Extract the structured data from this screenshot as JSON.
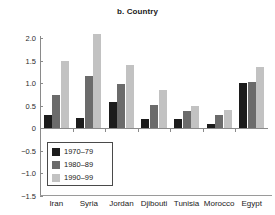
{
  "chart_data": {
    "type": "bar",
    "title": "b. Country",
    "xlabel": "",
    "ylabel": "",
    "ylim": [
      -1.5,
      2.0
    ],
    "ytick_labels": [
      "2.0",
      "1.5",
      "1.0",
      "0.5",
      "0",
      "−0.5",
      "−1.0",
      "−1.5"
    ],
    "ytick_values": [
      2.0,
      1.5,
      1.0,
      0.5,
      0,
      -0.5,
      -1.0,
      -1.5
    ],
    "grid": false,
    "legend_position": "lower-left-inside",
    "categories": [
      "Iran",
      "Syria",
      "Jordan",
      "Djibouti",
      "Tunisia",
      "Morocco",
      "Egypt"
    ],
    "series": [
      {
        "name": "1970–79",
        "color": "#1c1c1c",
        "values": [
          0.3,
          0.22,
          0.57,
          0.2,
          0.2,
          0.1,
          1.0
        ]
      },
      {
        "name": "1980–89",
        "color": "#6b6b6b",
        "values": [
          0.74,
          1.15,
          0.98,
          0.51,
          0.37,
          0.29,
          1.02
        ]
      },
      {
        "name": "1990–99",
        "color": "#c2c2c2",
        "values": [
          1.49,
          2.08,
          1.4,
          0.85,
          0.48,
          0.41,
          1.36
        ]
      }
    ]
  }
}
